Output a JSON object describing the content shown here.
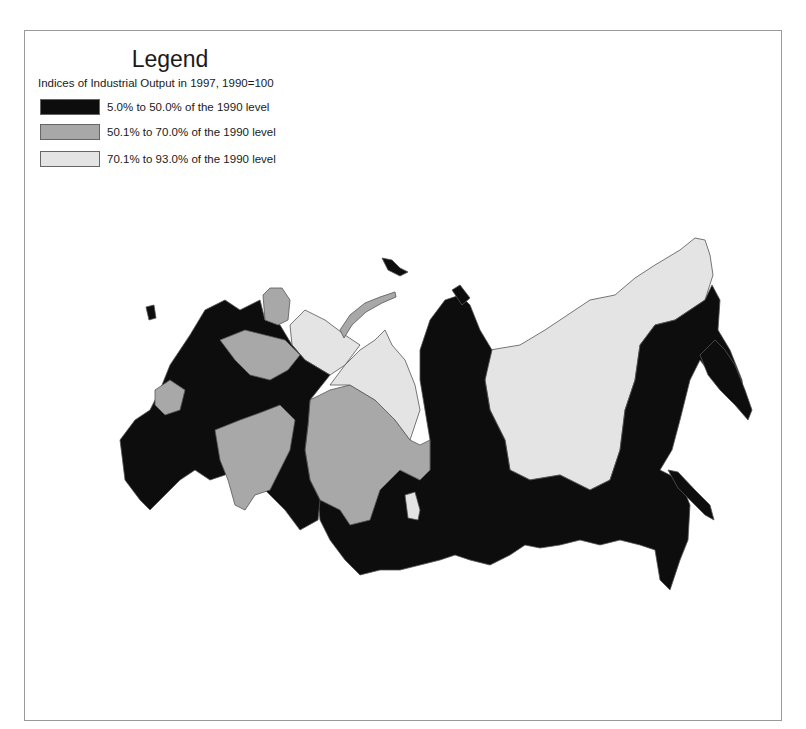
{
  "legend": {
    "title": "Legend",
    "subtitle": "Indices of Industrial Output in 1997, 1990=100",
    "classes": [
      {
        "label": "5.0% to 50.0% of the 1990 level",
        "color": "#0d0d0d",
        "min": 5.0,
        "max": 50.0
      },
      {
        "label": "50.1% to 70.0% of the 1990 level",
        "color": "#a8a8a8",
        "min": 50.1,
        "max": 70.0
      },
      {
        "label": "70.1% to 93.0% of the 1990 level",
        "color": "#e4e4e4",
        "min": 70.1,
        "max": 93.0
      }
    ]
  },
  "map": {
    "subject": "Russian Federation regions",
    "stroke_color": "#555555"
  }
}
